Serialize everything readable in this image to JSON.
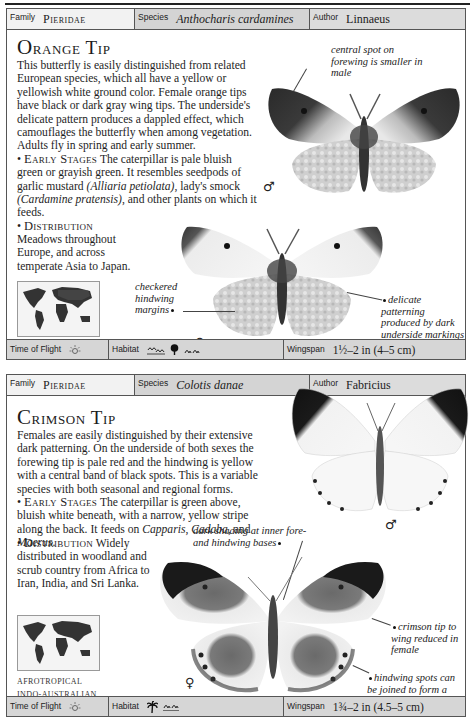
{
  "entries": [
    {
      "header": {
        "family_label": "Family",
        "family": "Pieridae",
        "species_label": "Species",
        "species": "Anthocharis cardamines",
        "author_label": "Author",
        "author": "Linnaeus"
      },
      "title": "Orange Tip",
      "description": "This butterfly is easily distinguished from related European species, which all have a yellow or yellowish white ground color. Female orange tips have black or dark gray wing tips. The underside's delicate pattern produces a dappled effect, which camouflages the butterfly when among vegetation. Adults fly in spring and early summer.",
      "early_stages_label": "Early Stages",
      "early_stages_text_1": "The caterpillar is pale bluish green or grayish green. It resembles seedpods of garlic mustard ",
      "early_stages_plant_1": "(Alliaria petiolata)",
      "early_stages_text_2": ", lady's smock ",
      "early_stages_plant_2": "(Cardamine pratensis)",
      "early_stages_text_3": ", and other plants on which it feeds.",
      "distribution_label": "Distribution",
      "distribution_text": "Meadows throughout Europe, and across temperate Asia to Japan.",
      "regions": [
        "PALEARCTIC"
      ],
      "captions": {
        "male_spot": "central spot on forewing is smaller in male",
        "checkered": "checkered hindwing margins",
        "delicate": "delicate patterning produced by dark underside markings showing through"
      },
      "male_symbol": "♂",
      "female_symbol": "♀",
      "footer": {
        "time_label": "Time of Flight",
        "time_icon": "sun-icon",
        "habitat_label": "Habitat",
        "habitat_icons": [
          "wetland-icon",
          "tree-icon",
          "grassland-icon"
        ],
        "wingspan_label": "Wingspan",
        "wingspan": "1½–2 in (4–5 cm)"
      }
    },
    {
      "header": {
        "family_label": "Family",
        "family": "Pieridae",
        "species_label": "Species",
        "species": "Colotis danae",
        "author_label": "Author",
        "author": "Fabricius"
      },
      "title": "Crimson Tip",
      "description": "Females are easily distinguished by their extensive dark patterning. On the underside of both sexes the forewing tip is pale red and the hindwing is yellow with a central band of black spots. This is a variable species with both seasonal and regional forms.",
      "early_stages_label": "Early Stages",
      "early_stages_text_1": "The caterpillar is green above, bluish white beneath, with a narrow, yellow stripe along the back. It feeds on ",
      "early_stages_plant_1": "Capparis",
      "early_stages_text_2": ", ",
      "early_stages_plant_2": "Cadaba",
      "early_stages_text_3": ", and ",
      "early_stages_plant_3": "Maerus",
      "early_stages_text_4": ".",
      "distribution_label": "Distribution",
      "distribution_text": "Widely distributed in woodland and scrub country from Africa to Iran, India, and Sri Lanka.",
      "regions": [
        "AFROTROPICAL",
        "INDO-AUSTRALIAN"
      ],
      "captions": {
        "dark_shading": "dark shading at inner fore- and hindwing bases",
        "crimson_tip": "crimson tip to wing reduced in female",
        "hindwing_spots": "hindwing spots can be joined to form a black band"
      },
      "male_symbol": "♂",
      "female_symbol": "♀",
      "footer": {
        "time_label": "Time of Flight",
        "time_icon": "sun-icon",
        "habitat_label": "Habitat",
        "habitat_icons": [
          "palm-tree-icon",
          "grassland-icon"
        ],
        "wingspan_label": "Wingspan",
        "wingspan": "1¾–2 in (4.5–5 cm)"
      }
    }
  ]
}
